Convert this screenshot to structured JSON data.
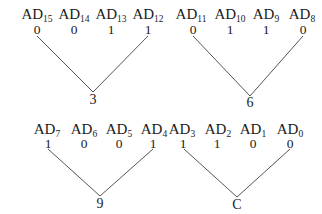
{
  "diagram": {
    "title": "",
    "groups": [
      {
        "lines": [
          {
            "x1": 37,
            "y1": 36,
            "x2": 93,
            "y2": 92
          },
          {
            "x1": 148,
            "y1": 36,
            "x2": 93,
            "y2": 92
          }
        ],
        "labels": [
          {
            "base": "AD",
            "sub": "15",
            "x": 37,
            "y": 19
          },
          {
            "base": "AD",
            "sub": "14",
            "x": 74,
            "y": 19
          },
          {
            "base": "AD",
            "sub": "13",
            "x": 111,
            "y": 19
          },
          {
            "base": "AD",
            "sub": "12",
            "x": 148,
            "y": 19
          }
        ],
        "bits": [
          {
            "value": "0",
            "x": 37,
            "y": 34
          },
          {
            "value": "0",
            "x": 74,
            "y": 34
          },
          {
            "value": "1",
            "x": 111,
            "y": 34
          },
          {
            "value": "1",
            "x": 148,
            "y": 34
          }
        ],
        "result": {
          "value": "3",
          "x": 93,
          "y": 104
        }
      },
      {
        "lines": [
          {
            "x1": 193,
            "y1": 36,
            "x2": 250,
            "y2": 96
          },
          {
            "x1": 303,
            "y1": 36,
            "x2": 250,
            "y2": 96
          }
        ],
        "labels": [
          {
            "base": "AD",
            "sub": "11",
            "x": 191,
            "y": 19
          },
          {
            "base": "AD",
            "sub": "10",
            "x": 230,
            "y": 19
          },
          {
            "base": "AD",
            "sub": "9",
            "x": 266,
            "y": 19
          },
          {
            "base": "AD",
            "sub": "8",
            "x": 302,
            "y": 19
          }
        ],
        "bits": [
          {
            "value": "0",
            "x": 193,
            "y": 34
          },
          {
            "value": "1",
            "x": 230,
            "y": 34
          },
          {
            "value": "1",
            "x": 266,
            "y": 34
          },
          {
            "value": "0",
            "x": 303,
            "y": 34
          }
        ],
        "result": {
          "value": "6",
          "x": 250,
          "y": 107
        }
      },
      {
        "lines": [
          {
            "x1": 48,
            "y1": 149,
            "x2": 100,
            "y2": 196
          },
          {
            "x1": 153,
            "y1": 149,
            "x2": 100,
            "y2": 196
          }
        ],
        "labels": [
          {
            "base": "AD",
            "sub": "7",
            "x": 47,
            "y": 134
          },
          {
            "base": "AD",
            "sub": "6",
            "x": 84,
            "y": 134
          },
          {
            "base": "AD",
            "sub": "5",
            "x": 119,
            "y": 134
          },
          {
            "base": "AD",
            "sub": "4",
            "x": 154,
            "y": 134
          }
        ],
        "bits": [
          {
            "value": "1",
            "x": 48,
            "y": 148
          },
          {
            "value": "0",
            "x": 84,
            "y": 148
          },
          {
            "value": "0",
            "x": 119,
            "y": 148
          },
          {
            "value": "1",
            "x": 153,
            "y": 148
          }
        ],
        "result": {
          "value": "9",
          "x": 100,
          "y": 208
        }
      },
      {
        "lines": [
          {
            "x1": 184,
            "y1": 149,
            "x2": 237,
            "y2": 197
          },
          {
            "x1": 290,
            "y1": 149,
            "x2": 237,
            "y2": 197
          }
        ],
        "labels": [
          {
            "base": "AD",
            "sub": "3",
            "x": 182,
            "y": 134
          },
          {
            "base": "AD",
            "sub": "2",
            "x": 218,
            "y": 134
          },
          {
            "base": "AD",
            "sub": "1",
            "x": 253,
            "y": 134
          },
          {
            "base": "AD",
            "sub": "0",
            "x": 290,
            "y": 134
          }
        ],
        "bits": [
          {
            "value": "1",
            "x": 183,
            "y": 148
          },
          {
            "value": "1",
            "x": 217,
            "y": 148
          },
          {
            "value": "0",
            "x": 253,
            "y": 148
          },
          {
            "value": "0",
            "x": 290,
            "y": 148
          }
        ],
        "result": {
          "value": "C",
          "x": 237,
          "y": 209
        }
      }
    ]
  }
}
